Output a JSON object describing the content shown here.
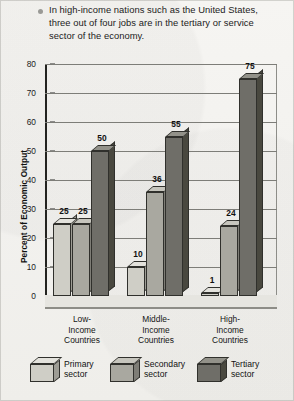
{
  "caption": {
    "bullet_icon": "bullet-dot-icon",
    "text": "In high-income nations such as the United States, three out of four jobs are in the tertiary or service sector of the economy."
  },
  "chart_data": {
    "type": "bar",
    "title": "",
    "xlabel": "",
    "ylabel": "Percent of Economic Output",
    "ylim": [
      0,
      80
    ],
    "ytick_labels": [
      "80",
      "70",
      "60",
      "50",
      "40",
      "30",
      "20",
      "10",
      "0"
    ],
    "ytick_values": [
      80,
      70,
      60,
      50,
      40,
      30,
      20,
      10,
      0
    ],
    "grid": true,
    "legend_position": "bottom",
    "style": "3d-bar",
    "categories": [
      "Low-\nIncome\nCountries",
      "Middle-\nIncome\nCountries",
      "High-\nIncome\nCountries"
    ],
    "category_lines": [
      [
        "Low-",
        "Income",
        "Countries"
      ],
      [
        "Middle-",
        "Income",
        "Countries"
      ],
      [
        "High-",
        "Income",
        "Countries"
      ]
    ],
    "series": [
      {
        "name": "Primary sector",
        "values": [
          25,
          10,
          1
        ],
        "color": "#cfcec6"
      },
      {
        "name": "Secondary sector",
        "values": [
          25,
          36,
          24
        ],
        "color": "#a9a8a0"
      },
      {
        "name": "Tertiary sector",
        "values": [
          50,
          55,
          75
        ],
        "color": "#6f6e68"
      }
    ],
    "data_labels": [
      [
        "25",
        "25",
        "50"
      ],
      [
        "10",
        "36",
        "55"
      ],
      [
        "1",
        "24",
        "75"
      ]
    ]
  },
  "legend": {
    "items": [
      {
        "label_line1": "Primary",
        "label_line2": "sector",
        "swatch": "cube-light-icon"
      },
      {
        "label_line1": "Secondary",
        "label_line2": "sector",
        "swatch": "cube-medium-icon"
      },
      {
        "label_line1": "Tertiary",
        "label_line2": "sector",
        "swatch": "cube-dark-icon"
      }
    ]
  }
}
